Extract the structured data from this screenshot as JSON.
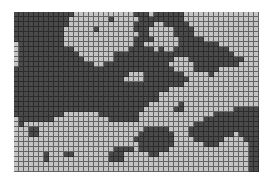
{
  "figure": {
    "type": "binary-grid-map",
    "cols": 49,
    "rows": 32,
    "cell_px": 5,
    "origin": [
      14,
      12
    ],
    "colors": {
      "D": "#4a4a4a",
      "M": "#8c8c8c",
      "L": "#c4c4c4",
      "W": "#e6e6e6",
      "gridline": "#222222"
    },
    "map": [
      "DDDDDDDDDDDDLLLLLLLLLLLLDDDLDDDDDDLLLLLLLLLLLLLLL",
      "DDDDDDDDDDDLLLLLLLLDLLLLLDDDDDDDDDLLLLLLLLLLLLLLL",
      "DDDDDDDDDDDLLLLLLLLLLLLLDDDDLLDDDDDLLLLLLLLLLLLLL",
      "DDDDDDDDDDLLLLLLDLLLLLLLDDDLLLLLDDDDLLLLLLLLLLLLL",
      "DDDDDDDDDDLLLLLLLLLLLLLLLDDLLLLLDDDDLLLLLLLLLLLLL",
      "DDDDDDDDDDLLLLLLLLLLLLLLDDDDLLLLLDDDDDLLLLLLLLLLL",
      "LDDDDDDDDDLLLLLLLLLLLLLLDDLLLLLLLDDDDDDDDLLLLLLLL",
      "LDDDDDDDDDDDLLLLLLLLLLLDDDDDLDLLDDDDDDDDDDDLLLLLL",
      "LDDDDDDDDDDDDLLLLLLLDDDDDDDDDDDDDDDDDDDDDDDDLLLLL",
      "LDDDDDDDDDDDDDLLLLLLDDDDDDDDDDDDLLLDDDDDDDDDDDLLL",
      "LDDDDDDDDDDDDDDDLLDDDDDDDDDDDDDLLLLLDDDDDDDDDLLLL",
      "DDDDDDDDDDDDDDDDDDDDDDDDDDDDDDDDLLLLDDDDDLLLLLLLL",
      "DDDDDDDDDDDDDDDDDDDDDDDLLLDDDDDDDDLLLLLDLLLLLLLLL",
      "DDDDDDDDDDDDDDDDDDDDDDLLLLDDDDDDDDDLLLLLLLLLLLLLL",
      "DDDDDDDDDDDDDDDDDDDDDDDDDDDDDDDDDDLLLLLLLLLLLLLLL",
      "DDDDDDDDDDDDDDDDDDDDDDDDDDDDDDDLLLLLLLLLLLLLLLLLL",
      "DDDDDDDDDDDDDDDDDDDDDDDDDDDDDLLLLLLLLLLLLLLLLLLLL",
      "DDDDDDDDDDDDDDDDDDDDDDDDDDDDDLLLLLLLLLLLLLLLLLLLL",
      "DDDDDDDDDDDDDDDDDDDDDDDDDDDLLLLLLDLLLLLLLLLLLLLLL",
      "DDDDDDDDDDDDDDDDDDDDDDDDDDLLLLLLDDLLLLLLLLLLDDDDD",
      "DDDDDDDDDDLLLLLLLDDDDDDDDLLLLLLLLLLLLLLLDDDDDDDDD",
      "LDDDDDDDLLLLLLLLLLLDDDDDDLLLLLLLLLLLLLDDDDDDDDDDD",
      "LDLLLLLLLLLLLLLLLLLLLLLLLLLLLLLLLLLLDDDDDDDDDDDDD",
      "LLLDDLLLLLLLLLLLLLLLLLLLLLDDDDDLLLLDDDDDDDDDDDDDD",
      "LLLDDLLLLLLLLLLLLLLLLLLLLDDDDDDDLLLDDDDDDDDDLDDDD",
      "LLLLLLLLLLLLLLLLLLLLLLLLDDDDDDDDLLLLDDDDDDLLLLDDD",
      "LLLLLLLLLLLLLLLLLLLLLLLLLDDDDDDDLLLLLLDDDLLLLLLDD",
      "LLLLLLLLLLLLLLLLLLLLDDDDLDDDDDDLLLLLLLLLLLLLLLLDD",
      "LLLLLLDLLLDDLLLLLLLDDDLLLLLDDLLLLLLLLLLLLLLLLLLDD",
      "LLLLLLDLLLLLLLLLLLLDDDLLLLLLLLLLLLLLLLLLLLLLLLLDD",
      "LLLLLLLLLLLLLLLLLLLLLLLLLLLLLLLLLLLLLLLLLLLLLLLDD",
      "LLLLLLLLLLLLLLLLLLLLLLLLLLLLLLLLLLLLLLLLLLLLLLLDD"
    ]
  }
}
